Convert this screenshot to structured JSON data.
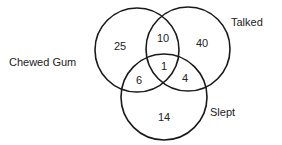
{
  "diagram": {
    "type": "venn-3",
    "sets": [
      {
        "name": "Chewed Gum",
        "label": "Chewed Gum",
        "circle": {
          "cx": 137,
          "cy": 50,
          "r": 42
        },
        "label_pos": {
          "x": 9,
          "y": 66
        }
      },
      {
        "name": "Talked",
        "label": "Talked",
        "circle": {
          "cx": 188,
          "cy": 49,
          "r": 42
        },
        "label_pos": {
          "x": 231,
          "y": 26
        }
      },
      {
        "name": "Slept",
        "label": "Slept",
        "circle": {
          "cx": 164,
          "cy": 97,
          "r": 43
        },
        "label_pos": {
          "x": 210,
          "y": 116
        }
      }
    ],
    "regions": [
      {
        "id": "gum_only",
        "sets": [
          "Chewed Gum"
        ],
        "value": "25",
        "pos": {
          "x": 120,
          "y": 50
        }
      },
      {
        "id": "talked_only",
        "sets": [
          "Talked"
        ],
        "value": "40",
        "pos": {
          "x": 202,
          "y": 47
        }
      },
      {
        "id": "slept_only",
        "sets": [
          "Slept"
        ],
        "value": "14",
        "pos": {
          "x": 164,
          "y": 121
        }
      },
      {
        "id": "gum_talked",
        "sets": [
          "Chewed Gum",
          "Talked"
        ],
        "value": "10",
        "pos": {
          "x": 163,
          "y": 42
        }
      },
      {
        "id": "gum_slept",
        "sets": [
          "Chewed Gum",
          "Slept"
        ],
        "value": "6",
        "pos": {
          "x": 139,
          "y": 84
        }
      },
      {
        "id": "talked_slept",
        "sets": [
          "Talked",
          "Slept"
        ],
        "value": "4",
        "pos": {
          "x": 185,
          "y": 82
        }
      },
      {
        "id": "all_three",
        "sets": [
          "Chewed Gum",
          "Talked",
          "Slept"
        ],
        "value": "1",
        "pos": {
          "x": 164,
          "y": 70
        }
      }
    ]
  }
}
